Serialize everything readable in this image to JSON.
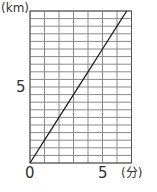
{
  "chart_data": {
    "type": "line",
    "title": "",
    "xlabel": "(分)",
    "ylabel": "(km)",
    "x_unit": "分",
    "y_unit": "km",
    "xlim": [
      0,
      7
    ],
    "ylim": [
      0,
      10
    ],
    "x_grid_step": 1,
    "y_grid_step": 0.5,
    "grid": true,
    "x_tick_labels": [
      "0",
      "5"
    ],
    "x_ticks": [
      0,
      5
    ],
    "y_tick_labels": [
      "5"
    ],
    "y_ticks": [
      5
    ],
    "series": [
      {
        "name": "distance",
        "x": [
          0,
          1,
          2,
          3,
          4,
          5,
          6,
          6.67
        ],
        "y": [
          0,
          1.5,
          3,
          4.5,
          6,
          7.5,
          9,
          10
        ]
      }
    ],
    "legend": null
  },
  "labels": {
    "ylabel": "(km)",
    "xlabel": "(分)",
    "y_tick_5": "5",
    "x_tick_0": "0",
    "x_tick_5": "5"
  },
  "colors": {
    "grid": "#8a8a8a",
    "border": "#555555",
    "line": "#222222",
    "text": "#333333"
  }
}
